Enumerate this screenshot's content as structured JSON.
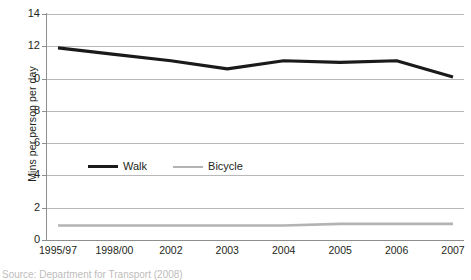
{
  "chart_data": {
    "type": "line",
    "title": "",
    "xlabel": "",
    "ylabel": "Mins per person per day",
    "categories": [
      "1995/97",
      "1998/00",
      "2002",
      "2003",
      "2004",
      "2005",
      "2006",
      "2007"
    ],
    "series": [
      {
        "name": "Walk",
        "color": "#1a1a1a",
        "values": [
          11.9,
          11.5,
          11.1,
          10.6,
          11.1,
          11.0,
          11.1,
          10.1
        ]
      },
      {
        "name": "Bicycle",
        "color": "#b3b3b3",
        "values": [
          0.9,
          0.9,
          0.9,
          0.9,
          0.9,
          1.0,
          1.0,
          1.0
        ]
      }
    ],
    "ylim": [
      0,
      14
    ],
    "yticks": [
      0,
      2,
      4,
      6,
      8,
      10,
      12,
      14
    ],
    "ytick_labels": [
      "0",
      "2",
      "4",
      "6",
      "8",
      "0",
      "12",
      "14"
    ],
    "grid": true,
    "legend_position": "inside-left-middle"
  },
  "legend": {
    "entries": [
      {
        "label": "Walk",
        "swatch": "walk-line-swatch"
      },
      {
        "label": "Bicycle",
        "swatch": "bicycle-line-swatch"
      }
    ]
  },
  "caption": {
    "source": "Source: Department for Transport (2008)"
  }
}
